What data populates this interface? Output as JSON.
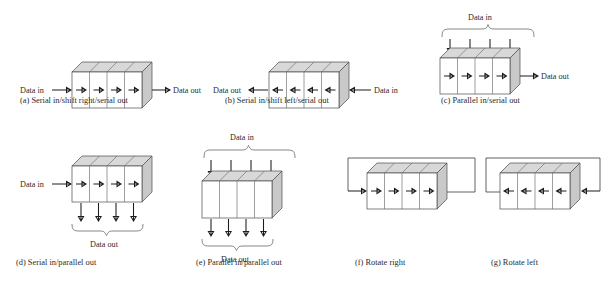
{
  "figure": {
    "background_color": "#ffffff",
    "cell_count": 4,
    "colors": {
      "top_face": "#d8d8d8",
      "side_face": "#c9c9c9",
      "front_face": "#ffffff",
      "outline": "#4a4a4a",
      "arrow": "#1c1c1c",
      "text": "#2b2b2b"
    }
  },
  "panels": [
    {
      "id": "a",
      "caption": "(a) Serial in/shift right/serial out",
      "left_label": "Data in",
      "right_label": "Data out",
      "top_label": "",
      "bottom_label": "",
      "direction": "right",
      "parallel_in": false,
      "parallel_out": false,
      "rotate": false
    },
    {
      "id": "b",
      "caption": "(b) Serial in/shift left/serial out",
      "left_label": "Data out",
      "right_label": "Data in",
      "top_label": "",
      "bottom_label": "",
      "direction": "left",
      "parallel_in": false,
      "parallel_out": false,
      "rotate": false
    },
    {
      "id": "c",
      "caption": "(c) Parallel in/serial out",
      "left_label": "",
      "right_label": "Data out",
      "top_label": "Data in",
      "bottom_label": "",
      "direction": "right",
      "parallel_in": true,
      "parallel_out": false,
      "rotate": false
    },
    {
      "id": "d",
      "caption": "(d) Serial in/parallel out",
      "left_label": "Data in",
      "right_label": "",
      "top_label": "",
      "bottom_label": "Data out",
      "direction": "right",
      "parallel_in": false,
      "parallel_out": true,
      "rotate": false
    },
    {
      "id": "e",
      "caption": "(e) Parallel in/parallel out",
      "left_label": "",
      "right_label": "",
      "top_label": "Data in",
      "bottom_label": "Data out",
      "direction": "none",
      "parallel_in": true,
      "parallel_out": true,
      "rotate": false
    },
    {
      "id": "f",
      "caption": "(f) Rotate right",
      "left_label": "",
      "right_label": "",
      "top_label": "",
      "bottom_label": "",
      "direction": "right",
      "parallel_in": false,
      "parallel_out": false,
      "rotate": true
    },
    {
      "id": "g",
      "caption": "(g) Rotate left",
      "left_label": "",
      "right_label": "",
      "top_label": "",
      "bottom_label": "",
      "direction": "left",
      "parallel_in": false,
      "parallel_out": false,
      "rotate": true
    }
  ]
}
